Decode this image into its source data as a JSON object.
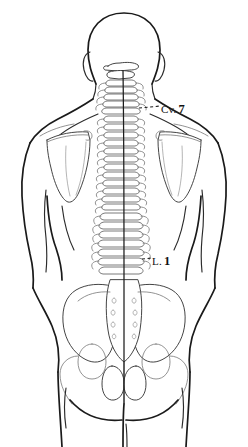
{
  "figure": {
    "view": "posterior",
    "background_color": "#ffffff",
    "line_color": "#1a1a1a",
    "bone_line_color": "#585858"
  },
  "labels": [
    {
      "id": "cv7",
      "prefix": "Cv.",
      "number": "7",
      "full_text": "Cv. 7",
      "meaning": "seventh cervical vertebra",
      "leader": "dashed"
    },
    {
      "id": "l1",
      "prefix": "L.",
      "number": "1",
      "full_text": "L. 1",
      "meaning": "first lumbar vertebra",
      "leader": "dashed"
    }
  ],
  "regions": [
    {
      "name": "head"
    },
    {
      "name": "cervical-spine"
    },
    {
      "name": "shoulder-girdle"
    },
    {
      "name": "left-scapula"
    },
    {
      "name": "right-scapula"
    },
    {
      "name": "thoracic-spine"
    },
    {
      "name": "lumbar-spine"
    },
    {
      "name": "pelvis"
    },
    {
      "name": "sacrum"
    },
    {
      "name": "left-arm"
    },
    {
      "name": "right-arm"
    },
    {
      "name": "thighs"
    }
  ]
}
